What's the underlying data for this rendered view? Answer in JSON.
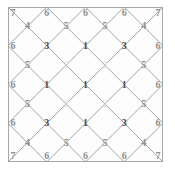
{
  "figure": {
    "board": {
      "x": 8,
      "y": 7,
      "size": 155,
      "border_color": "#a8a8a8",
      "fill_color": "#fdfdfd",
      "line_color": "#9b9b9b"
    },
    "geometry": {
      "vertex_cols": 5,
      "vertex_rows": 5,
      "cell_cols": 4,
      "cell_rows": 4,
      "step": 38.75
    },
    "palette": {
      "dark": "#4a4a4a",
      "mid": "#8e8e8e",
      "light": "#c9c9c9",
      "pale": "#e2e2e2"
    }
  },
  "chart_data": {
    "type": "heatmap",
    "title": "",
    "xlabel": "",
    "ylabel": "",
    "vertex_values": [
      [
        7,
        6,
        6,
        6,
        7
      ],
      [
        6,
        3,
        1,
        3,
        6
      ],
      [
        6,
        1,
        1,
        1,
        6
      ],
      [
        6,
        3,
        1,
        3,
        6
      ],
      [
        7,
        6,
        6,
        6,
        7
      ]
    ],
    "center_values": [
      [
        4,
        5,
        5,
        4
      ],
      [
        5,
        2,
        2,
        5
      ],
      [
        5,
        2,
        2,
        5
      ],
      [
        4,
        5,
        5,
        4
      ]
    ],
    "vertex_tones": [
      [
        "mid",
        "mid",
        "mid",
        "mid",
        "mid"
      ],
      [
        "mid",
        "dark",
        "dark",
        "dark",
        "mid"
      ],
      [
        "mid",
        "dark",
        "dark",
        "dark",
        "mid"
      ],
      [
        "mid",
        "dark",
        "dark",
        "dark",
        "mid"
      ],
      [
        "mid",
        "mid",
        "mid",
        "mid",
        "mid"
      ]
    ],
    "center_tones": [
      [
        "mid",
        "mid",
        "mid",
        "mid"
      ],
      [
        "mid",
        "pale",
        "pale",
        "mid"
      ],
      [
        "mid",
        "pale",
        "pale",
        "mid"
      ],
      [
        "mid",
        "mid",
        "mid",
        "mid"
      ]
    ],
    "legend": [],
    "grid": true
  }
}
